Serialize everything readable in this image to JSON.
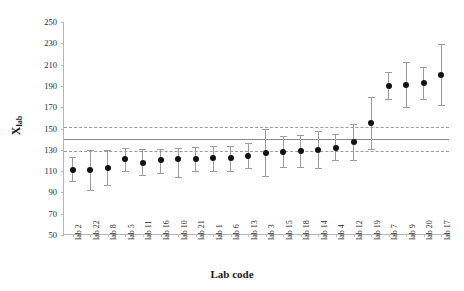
{
  "chart_data": {
    "type": "scatter",
    "title": "",
    "xlabel": "Lab code",
    "ylabel": "X_lab",
    "ylabel_base": "X",
    "ylabel_sub": "lab",
    "ylim": [
      50,
      250
    ],
    "ytick_step": 20,
    "yticks": [
      50,
      70,
      90,
      110,
      130,
      150,
      170,
      190,
      210,
      230,
      250
    ],
    "grid": false,
    "legend": "none",
    "categories": [
      "lab 2",
      "lab 22",
      "lab 8",
      "lab 5",
      "lab 11",
      "lab 16",
      "lab 10",
      "lab 21",
      "lab 1",
      "lab 6",
      "lab 13",
      "lab 3",
      "lab 15",
      "lab 18",
      "lab 14",
      "lab 4",
      "lab 12",
      "lab 19",
      "lab 7",
      "lab 9",
      "lab 20",
      "lab 17"
    ],
    "values": [
      111,
      111,
      113,
      121,
      118,
      120,
      121,
      121,
      122,
      122,
      124,
      127,
      128,
      129,
      130,
      132,
      137,
      155,
      190,
      191,
      193,
      200
    ],
    "error_low": [
      101,
      92,
      97,
      110,
      106,
      108,
      104,
      110,
      110,
      110,
      113,
      105,
      114,
      114,
      113,
      120,
      120,
      131,
      178,
      170,
      178,
      172
    ],
    "error_high": [
      123,
      130,
      130,
      132,
      131,
      131,
      132,
      133,
      134,
      134,
      136,
      150,
      143,
      144,
      148,
      145,
      154,
      180,
      203,
      212,
      208,
      229
    ],
    "reference_lines": [
      {
        "name": "upper-limit",
        "value": 151,
        "style": "dashed"
      },
      {
        "name": "assigned-value",
        "value": 140,
        "style": "solid"
      },
      {
        "name": "lower-limit",
        "value": 129,
        "style": "dashed"
      }
    ]
  }
}
